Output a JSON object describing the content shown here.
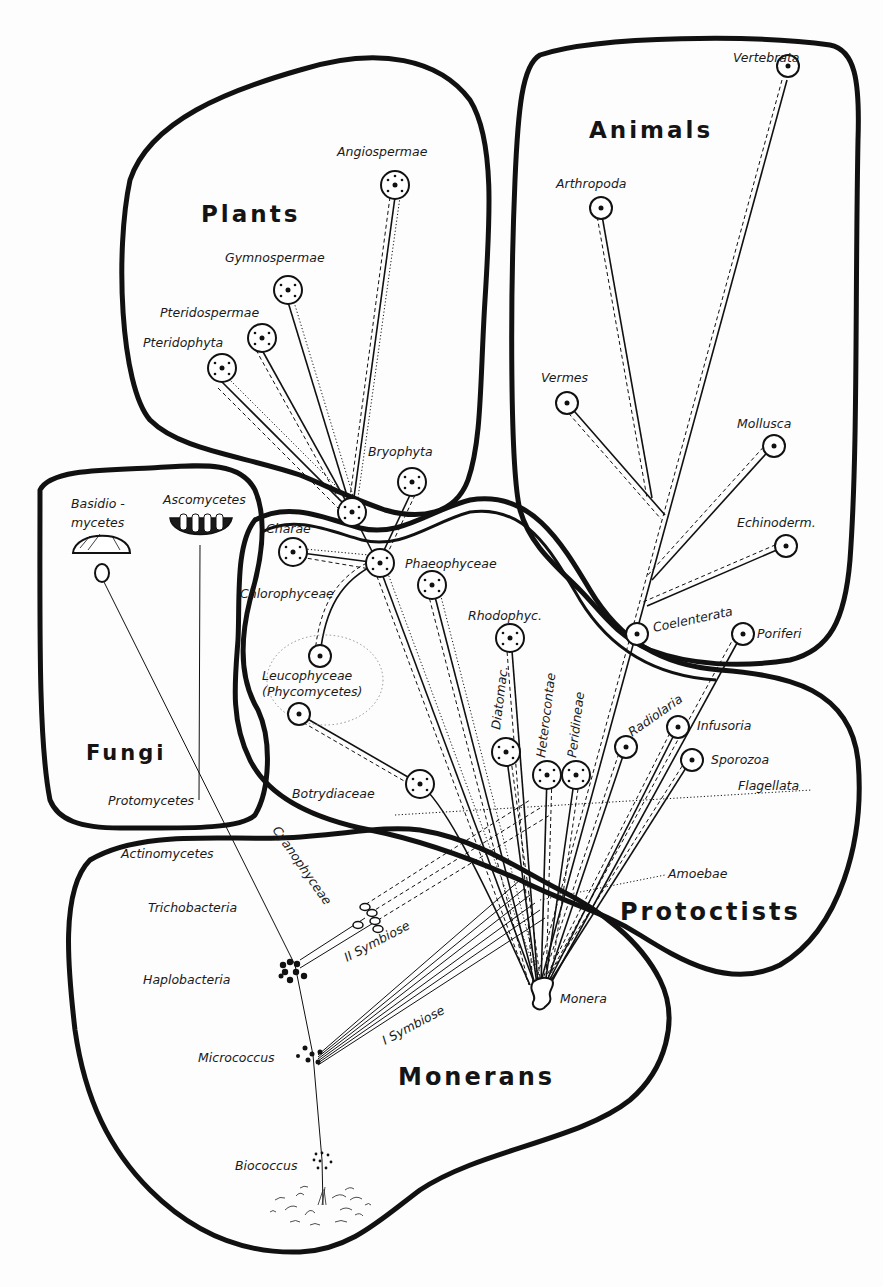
{
  "kingdoms": {
    "plants": "Plants",
    "animals": "Animals",
    "fungi": "Fungi",
    "protoctists": "Protoctists",
    "monerans": "Monerans"
  },
  "taxa": {
    "angiospermae": "Angiospermae",
    "gymnospermae": "Gymnospermae",
    "pteridospermae": "Pteridospermae",
    "pteridophyta": "Pteridophyta",
    "bryophyta": "Bryophyta",
    "vertebrata": "Vertebrata",
    "arthropoda": "Arthropoda",
    "vermes": "Vermes",
    "mollusca": "Mollusca",
    "echinoderm": "Echinoderm.",
    "coelenterata": "Coelenterata",
    "poriferi": "Poriferi",
    "basidio_1": "Basidio -",
    "basidio_2": "mycetes",
    "ascomycetes": "Ascomycetes",
    "protomycetes": "Protomycetes",
    "charae": "Charae",
    "chlorophyceae": "Chlorophyceae",
    "phaeophyceae": "Phaeophyceae",
    "rhodophyc": "Rhodophyc.",
    "leucophyceae": "Leucophyceae",
    "phycomycetes": "(Phycomycetes)",
    "diatomac": "Diatomac.",
    "heterocontae": "Heterocontae",
    "peridineae": "Peridineae",
    "radiolaria": "Radiolaria",
    "infusoria": "Infusoria",
    "sporozoa": "Sporozoa",
    "flagellata": "Flagellata",
    "amoebae": "Amoebae",
    "botrydiaceae": "Botrydiaceae",
    "actinomycetes": "Actinomycetes",
    "cyanophyceae": "Cyanophyceae",
    "trichobacteria": "Trichobacteria",
    "haplobacteria": "Haplobacteria",
    "micrococcus": "Micrococcus",
    "biococcus": "Biococcus",
    "monera": "Monera",
    "symbiose_1": "I  Symbiose",
    "symbiose_2": "II  Symbiose"
  }
}
